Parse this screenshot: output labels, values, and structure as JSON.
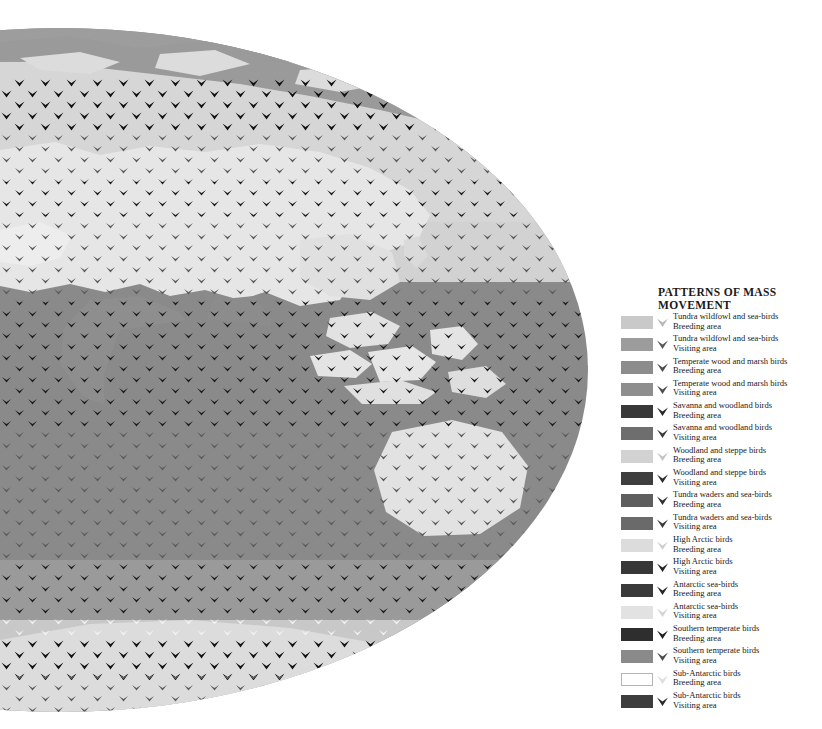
{
  "map": {
    "name": "world-bird-migration-map",
    "projection": "mollweide-ellipse",
    "description": "World map in elliptical projection tiled with bird chevron glyphs showing mass movement patterns",
    "ocean_color": "#8a8a8a",
    "background_color": "#ffffff",
    "regions": [
      {
        "name": "arctic-tundra-band",
        "color": "#d4d4d4"
      },
      {
        "name": "north-temperate-band",
        "color": "#d8d8d8"
      },
      {
        "name": "eurasia-landmass",
        "color": "#e3e3e3"
      },
      {
        "name": "africa-arabia-landmass",
        "color": "#8e8e8e"
      },
      {
        "name": "indian-ocean",
        "color": "#8a8a8a"
      },
      {
        "name": "australia-landmass",
        "color": "#e0e0e0"
      },
      {
        "name": "southeast-asia-islands",
        "color": "#e6e6e6"
      },
      {
        "name": "southern-ocean",
        "color": "#9a9a9a"
      },
      {
        "name": "antarctic-band",
        "color": "#d0d0d0"
      }
    ]
  },
  "legend": {
    "title": "PATTERNS OF MASS MOVEMENT",
    "items": [
      {
        "name": "Tundra wildfowl and sea-birds",
        "kind": "Breeding area",
        "color": "#c9c9c9",
        "bird": "#b8b8b8",
        "outlined": false
      },
      {
        "name": "Tundra wildfowl and sea-birds",
        "kind": "Visiting area",
        "color": "#9c9c9c",
        "bird": "#5a5a5a",
        "outlined": false
      },
      {
        "name": "Temperate wood and marsh birds",
        "kind": "Breeding area",
        "color": "#8c8c8c",
        "bird": "#4a4a4a",
        "outlined": false
      },
      {
        "name": "Temperate wood and marsh birds",
        "kind": "Visiting area",
        "color": "#8e8e8e",
        "bird": "#4e4e4e",
        "outlined": false
      },
      {
        "name": "Savanna and woodland birds",
        "kind": "Breeding area",
        "color": "#383838",
        "bird": "#272727",
        "outlined": false
      },
      {
        "name": "Savanna and woodland birds",
        "kind": "Visiting area",
        "color": "#6e6e6e",
        "bird": "#3a3a3a",
        "outlined": false
      },
      {
        "name": "Woodland and steppe birds",
        "kind": "Breeding area",
        "color": "#d2d2d2",
        "bird": "#c4c4c4",
        "outlined": false
      },
      {
        "name": "Woodland and steppe birds",
        "kind": "Visiting area",
        "color": "#3e3e3e",
        "bird": "#2b2b2b",
        "outlined": false
      },
      {
        "name": "Tundra waders and sea-birds",
        "kind": "Breeding area",
        "color": "#5e5e5e",
        "bird": "#303030",
        "outlined": false
      },
      {
        "name": "Tundra waders and sea-birds",
        "kind": "Visiting area",
        "color": "#6a6a6a",
        "bird": "#3a3a3a",
        "outlined": false
      },
      {
        "name": "High Arctic birds",
        "kind": "Breeding area",
        "color": "#dcdcdc",
        "bird": "#cfcfcf",
        "outlined": false
      },
      {
        "name": "High Arctic birds",
        "kind": "Visiting area",
        "color": "#373737",
        "bird": "#242424",
        "outlined": false
      },
      {
        "name": "Antarctic sea-birds",
        "kind": "Breeding area",
        "color": "#3a3a3a",
        "bird": "#252525",
        "outlined": false
      },
      {
        "name": "Antarctic sea-birds",
        "kind": "Visiting area",
        "color": "#e2e2e2",
        "bird": "#d4d4d4",
        "outlined": false
      },
      {
        "name": "Southern temperate birds",
        "kind": "Breeding area",
        "color": "#2e2e2e",
        "bird": "#1f1f1f",
        "outlined": false
      },
      {
        "name": "Southern temperate birds",
        "kind": "Visiting area",
        "color": "#8a8a8a",
        "bird": "#4c4c4c",
        "outlined": false
      },
      {
        "name": "Sub-Antarctic birds",
        "kind": "Breeding area",
        "color": "#ffffff",
        "bird": "#dedede",
        "outlined": true
      },
      {
        "name": "Sub-Antarctic birds",
        "kind": "Visiting area",
        "color": "#3d3d3d",
        "bird": "#2a2a2a",
        "outlined": false
      }
    ]
  }
}
